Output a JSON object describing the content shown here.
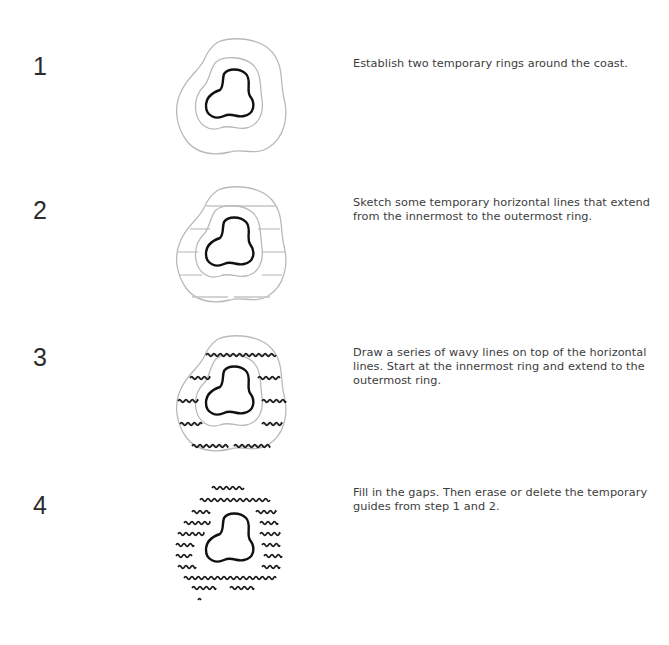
{
  "steps": [
    {
      "number": "1",
      "text": "Establish two temporary rings around the coast.",
      "figure": {
        "outer_ring": true,
        "inner_ring": true,
        "horizontal_guides": false,
        "wavy_lines": "none"
      }
    },
    {
      "number": "2",
      "text": "Sketch some temporary horizontal lines that extend from the innermost to the outermost ring.",
      "figure": {
        "outer_ring": true,
        "inner_ring": true,
        "horizontal_guides": true,
        "wavy_lines": "none"
      }
    },
    {
      "number": "3",
      "text": "Draw a series of wavy lines on top of the horizontal lines. Start at the innermost ring and extend to the outermost ring.",
      "figure": {
        "outer_ring": true,
        "inner_ring": true,
        "horizontal_guides": true,
        "wavy_lines": "on-guides"
      }
    },
    {
      "number": "4",
      "text": "Fill in the gaps. Then erase or delete the temporary guides from step 1 and 2.",
      "figure": {
        "outer_ring": false,
        "inner_ring": false,
        "horizontal_guides": false,
        "wavy_lines": "filled"
      }
    }
  ],
  "colors": {
    "island_stroke": "#111111",
    "guide_stroke": "#b9b9b9",
    "wave_stroke": "#1a1a1a",
    "text": "#3c3c3c"
  }
}
